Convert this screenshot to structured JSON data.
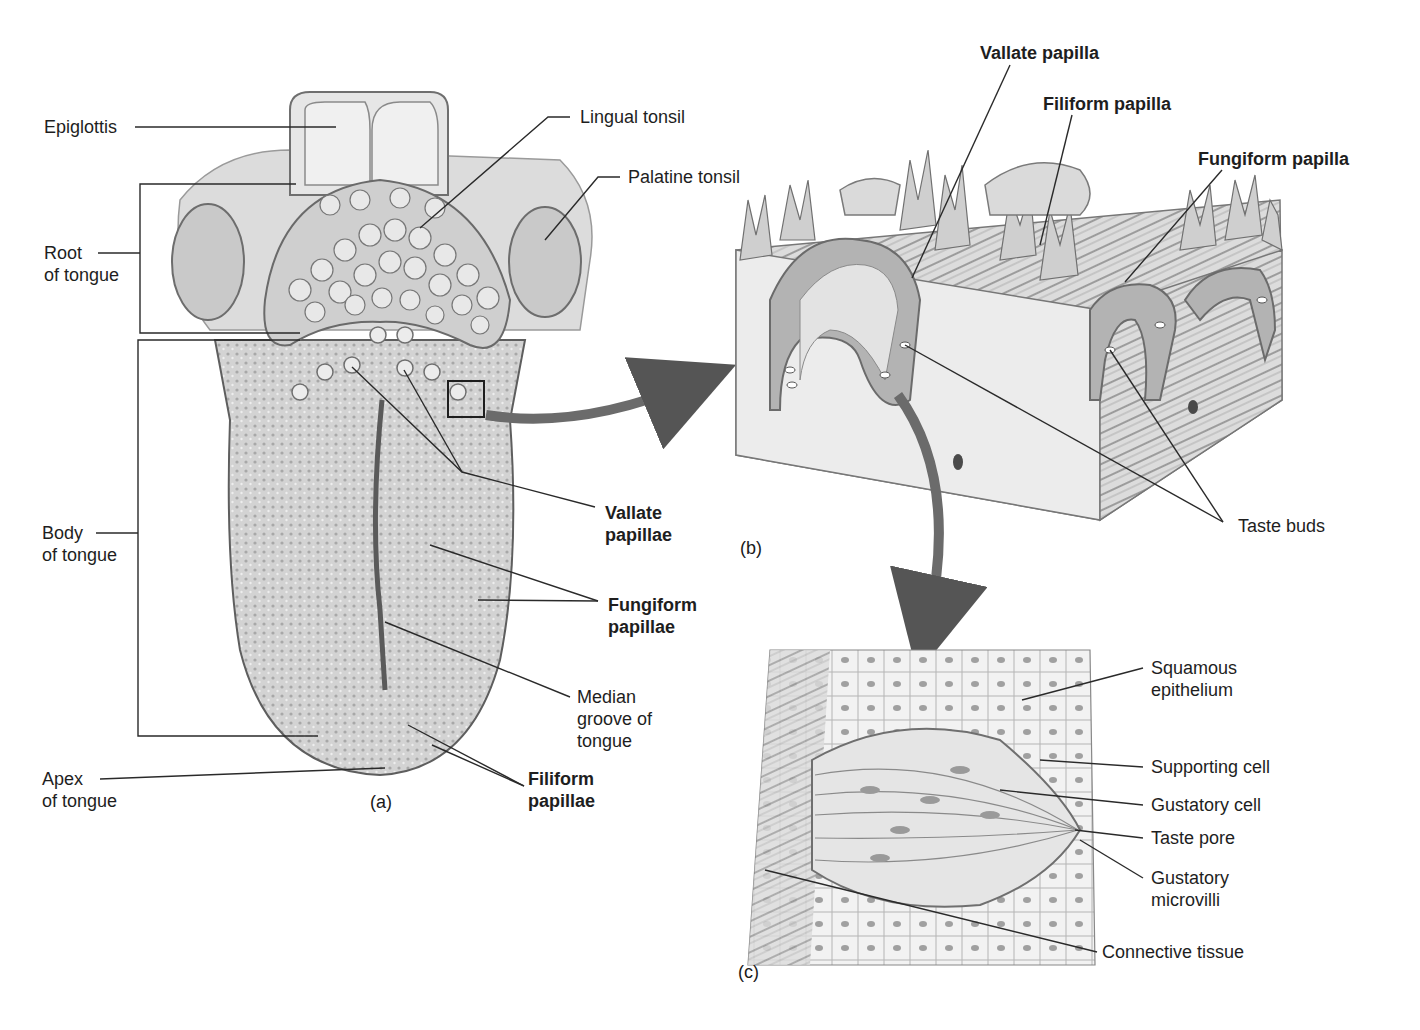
{
  "figure": {
    "panels": [
      {
        "id": "a",
        "caption": "(a)",
        "subject": "dorsal surface of tongue"
      },
      {
        "id": "b",
        "caption": "(b)",
        "subject": "papillae block section"
      },
      {
        "id": "c",
        "caption": "(c)",
        "subject": "taste bud detail"
      }
    ]
  },
  "labels_a": {
    "epiglottis": "Epiglottis",
    "lingual_tonsil": "Lingual tonsil",
    "palatine_tonsil": "Palatine tonsil",
    "root": "Root\nof tongue",
    "body": "Body\nof tongue",
    "apex": "Apex\nof tongue",
    "vallate": "Vallate\npapillae",
    "fungiform": "Fungiform\npapillae",
    "median_groove": "Median\ngroove of\ntongue",
    "filiform": "Filiform\npapillae"
  },
  "labels_b": {
    "vallate": "Vallate papilla",
    "filiform": "Filiform papilla",
    "fungiform": "Fungiform papilla",
    "taste_buds": "Taste buds"
  },
  "labels_c": {
    "squamous": "Squamous\nepithelium",
    "supporting": "Supporting cell",
    "gustatory_cell": "Gustatory cell",
    "taste_pore": "Taste pore",
    "microvilli": "Gustatory\nmicrovilli",
    "connective": "Connective tissue"
  },
  "colors": {
    "ink": "#1e1e1e",
    "tissue_light": "#e4e4e4",
    "tissue_mid": "#bdbdbd",
    "tissue_dark": "#8a8a8a"
  }
}
